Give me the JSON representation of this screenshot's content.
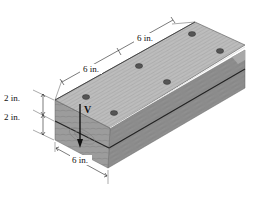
{
  "figure": {
    "colors": {
      "top_face": "#b9b9b9",
      "front_face": "#8c8c8c",
      "end_face": "#9a9a9a",
      "seam": "#222222",
      "nail": "#555555",
      "arrow": "#111111"
    }
  },
  "dimensions": {
    "spacing_1": "6 in.",
    "spacing_2": "6 in.",
    "width": "6 in.",
    "thickness_top": "2 in.",
    "thickness_bottom": "2 in."
  },
  "load": {
    "label": "V",
    "direction": "down"
  },
  "nails": [
    {
      "x": 86,
      "y": 97
    },
    {
      "x": 139,
      "y": 66
    },
    {
      "x": 192,
      "y": 34
    },
    {
      "x": 114,
      "y": 113
    },
    {
      "x": 167,
      "y": 82
    },
    {
      "x": 220,
      "y": 51
    }
  ]
}
